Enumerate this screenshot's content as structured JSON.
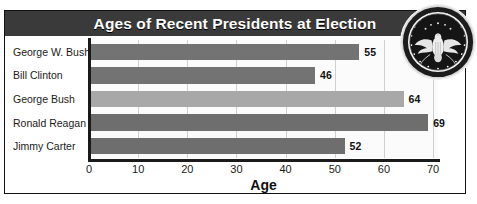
{
  "chart_data": {
    "type": "bar",
    "orientation": "horizontal",
    "title": "Ages of Recent Presidents at Election",
    "xlabel": "Age",
    "ylabel": "",
    "categories": [
      "George W. Bush",
      "Bill Clinton",
      "George Bush",
      "Ronald Reagan",
      "Jimmy Carter"
    ],
    "values": [
      55,
      46,
      64,
      69,
      52
    ],
    "bar_colors": [
      "#737373",
      "#737373",
      "#a8a8a8",
      "#6e6e6e",
      "#6e6e6e"
    ],
    "xlim": [
      0,
      71
    ],
    "xticks": [
      0,
      10,
      20,
      30,
      40,
      50,
      60,
      70
    ],
    "xtick_labels": [
      "0",
      "10",
      "20",
      "30",
      "40",
      "50",
      "60",
      "70"
    ],
    "grid": true,
    "grid_axis": "x",
    "legend": false,
    "data_labels": [
      "55",
      "46",
      "64",
      "69",
      "52"
    ]
  },
  "header": {
    "title": "Ages of Recent Presidents at Election",
    "background_color": "#3a3a3a",
    "text_color": "#ffffff"
  },
  "seal": {
    "name": "presidential-seal",
    "outer_text_top": "SEAL OF THE PRESIDENT OF THE UNITED STATES"
  }
}
